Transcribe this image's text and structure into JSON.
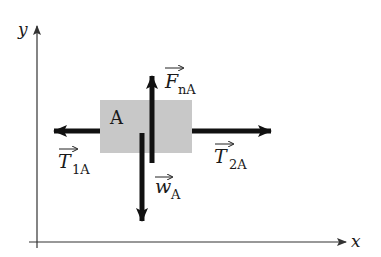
{
  "diagram": {
    "type": "free-body-diagram",
    "axes": {
      "x_label": "x",
      "y_label": "y"
    },
    "object": {
      "label": "A",
      "fill_color": "#c8c8c8"
    },
    "forces": [
      {
        "id": "F_nA",
        "symbol": "F",
        "subscript": "nA",
        "direction": "up"
      },
      {
        "id": "w_A",
        "symbol": "w",
        "subscript": "A",
        "direction": "down"
      },
      {
        "id": "T_1A",
        "symbol": "T",
        "subscript": "1A",
        "direction": "left"
      },
      {
        "id": "T_2A",
        "symbol": "T",
        "subscript": "2A",
        "direction": "right"
      }
    ],
    "arrow_color": "#111111",
    "axis_color": "#333333"
  }
}
